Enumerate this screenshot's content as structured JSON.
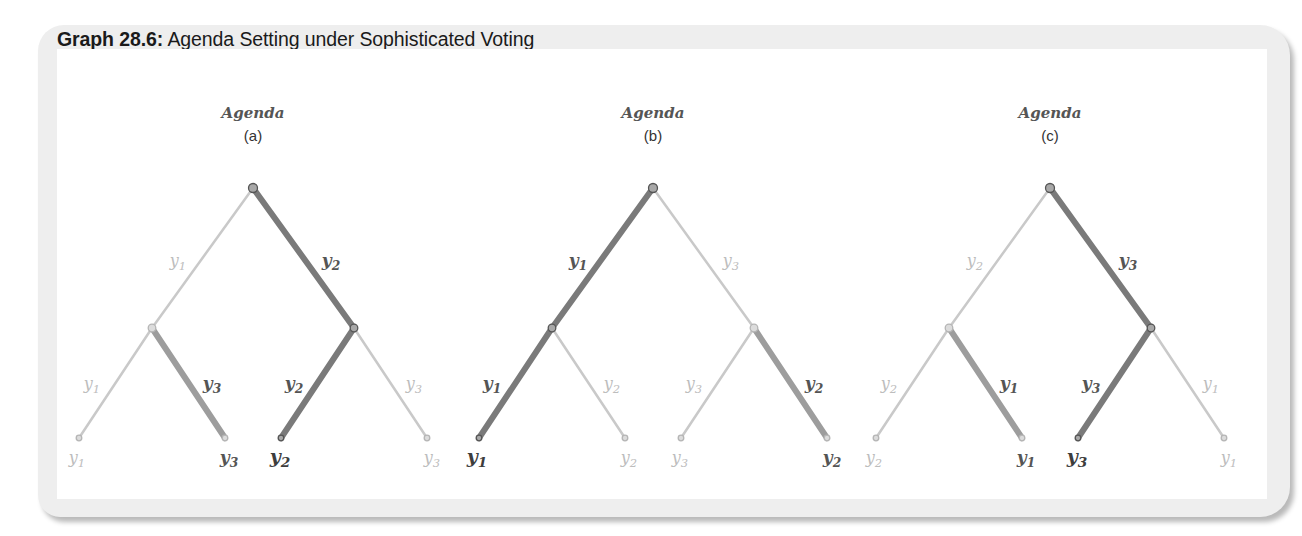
{
  "figure": {
    "title_bold": "Graph 28.6:",
    "title_rest": " Agenda Setting under Sophisticated Voting"
  },
  "colors": {
    "panel_bg": "#eeeeee",
    "edge_winner_dark": "#7a7a7a",
    "edge_winner_mid": "#9d9d9d",
    "edge_loser": "#c9c9c9",
    "label_winner": "#555555",
    "label_loser": "#bdbdbd"
  },
  "trees": [
    {
      "heading": "Agenda",
      "subheading": "(a)",
      "top_left": {
        "label": "y1",
        "base": "y",
        "sub": "1",
        "highlight": false
      },
      "top_right": {
        "label": "y2",
        "base": "y",
        "sub": "2",
        "highlight": true
      },
      "left_left": {
        "label": "y1",
        "base": "y",
        "sub": "1",
        "highlight": false
      },
      "left_right": {
        "label": "y3",
        "base": "y",
        "sub": "3",
        "highlight": true
      },
      "right_left": {
        "label": "y2",
        "base": "y",
        "sub": "2",
        "highlight": true
      },
      "right_right": {
        "label": "y3",
        "base": "y",
        "sub": "3",
        "highlight": false
      },
      "leaves": [
        {
          "base": "y",
          "sub": "1",
          "style": "lo"
        },
        {
          "base": "y",
          "sub": "3",
          "style": "hi"
        },
        {
          "base": "y",
          "sub": "2",
          "style": "final"
        },
        {
          "base": "y",
          "sub": "3",
          "style": "lo"
        }
      ],
      "outcome": "y2"
    },
    {
      "heading": "Agenda",
      "subheading": "(b)",
      "top_left": {
        "label": "y1",
        "base": "y",
        "sub": "1",
        "highlight": true
      },
      "top_right": {
        "label": "y3",
        "base": "y",
        "sub": "3",
        "highlight": false
      },
      "left_left": {
        "label": "y1",
        "base": "y",
        "sub": "1",
        "highlight": true
      },
      "left_right": {
        "label": "y2",
        "base": "y",
        "sub": "2",
        "highlight": false
      },
      "right_left": {
        "label": "y3",
        "base": "y",
        "sub": "3",
        "highlight": false
      },
      "right_right": {
        "label": "y2",
        "base": "y",
        "sub": "2",
        "highlight": true
      },
      "leaves": [
        {
          "base": "y",
          "sub": "1",
          "style": "final"
        },
        {
          "base": "y",
          "sub": "2",
          "style": "lo"
        },
        {
          "base": "y",
          "sub": "3",
          "style": "lo"
        },
        {
          "base": "y",
          "sub": "2",
          "style": "hi"
        }
      ],
      "outcome": "y1"
    },
    {
      "heading": "Agenda",
      "subheading": "(c)",
      "top_left": {
        "label": "y2",
        "base": "y",
        "sub": "2",
        "highlight": false
      },
      "top_right": {
        "label": "y3",
        "base": "y",
        "sub": "3",
        "highlight": true
      },
      "left_left": {
        "label": "y2",
        "base": "y",
        "sub": "2",
        "highlight": false
      },
      "left_right": {
        "label": "y1",
        "base": "y",
        "sub": "1",
        "highlight": true
      },
      "right_left": {
        "label": "y3",
        "base": "y",
        "sub": "3",
        "highlight": true
      },
      "right_right": {
        "label": "y1",
        "base": "y",
        "sub": "1",
        "highlight": false
      },
      "leaves": [
        {
          "base": "y",
          "sub": "2",
          "style": "lo"
        },
        {
          "base": "y",
          "sub": "1",
          "style": "hi"
        },
        {
          "base": "y",
          "sub": "3",
          "style": "final"
        },
        {
          "base": "y",
          "sub": "1",
          "style": "lo"
        }
      ],
      "outcome": "y3"
    }
  ]
}
